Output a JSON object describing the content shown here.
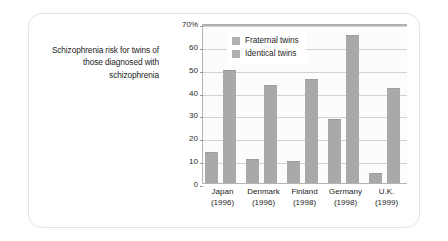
{
  "caption": "Schizophrenia risk for twins of those diagnosed with schizophrenia",
  "legend": {
    "items": [
      {
        "label": "Fraternal twins",
        "swatch_name": "legend-swatch-fraternal",
        "color": "#b0b0b0"
      },
      {
        "label": "Identical twins",
        "swatch_name": "legend-swatch-identical",
        "color": "#b0b0b0"
      }
    ]
  },
  "axis": {
    "y_ticks": [
      "70%",
      "60",
      "50",
      "40",
      "30",
      "20",
      "10",
      "0"
    ],
    "y_tick_values": [
      70,
      60,
      50,
      40,
      30,
      20,
      10,
      0
    ]
  },
  "colors": {
    "bar": "#a9a9a9",
    "gridline": "#d2d2d2",
    "axis": "#b4b4b4",
    "card_border": "#e3e3e3",
    "plot_background": "#fcfcfc",
    "text": "#1d1d1d"
  },
  "chart_data": {
    "type": "bar",
    "title": "Schizophrenia risk for twins of those diagnosed with schizophrenia",
    "xlabel": "",
    "ylabel": "",
    "ylim": [
      0,
      70
    ],
    "ytick_step": 10,
    "ytick_suffix": "%",
    "grid": true,
    "legend_position": "top-left-inside",
    "categories": [
      "Japan\n(1996)",
      "Denmark\n(1996)",
      "Finland\n(1998)",
      "Germany\n(1998)",
      "U.K.\n(1999)"
    ],
    "category_labels": [
      {
        "country": "Japan",
        "year": "(1996)"
      },
      {
        "country": "Denmark",
        "year": "(1996)"
      },
      {
        "country": "Finland",
        "year": "(1998)"
      },
      {
        "country": "Germany",
        "year": "(1998)"
      },
      {
        "country": "U.K.",
        "year": "(1999)"
      }
    ],
    "series": [
      {
        "name": "Fraternal twins",
        "values": [
          14,
          11,
          10,
          28.5,
          5
        ]
      },
      {
        "name": "Identical twins",
        "values": [
          50,
          43.5,
          46,
          65,
          42
        ]
      }
    ]
  }
}
